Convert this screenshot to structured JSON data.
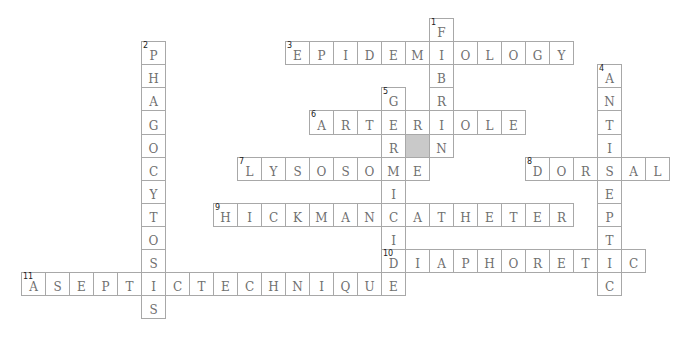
{
  "puzzle": {
    "origin_x": 21,
    "origin_y": 18,
    "cell_w": 24,
    "cell_h": 23.1,
    "colors": {
      "border": "#a8a8a8",
      "shaded": "#c9c9c9",
      "letter": "#6f6f6f"
    },
    "entries": [
      {
        "number": 1,
        "direction": "down",
        "answer": "FIBRIN",
        "row": 0,
        "col": 17
      },
      {
        "number": 2,
        "direction": "down",
        "answer": "PHAGOCYTOSIS",
        "row": 1,
        "col": 5
      },
      {
        "number": 3,
        "direction": "across",
        "answer": "EPIDEMIOLOGY",
        "row": 1,
        "col": 11
      },
      {
        "number": 4,
        "direction": "down",
        "answer": "ANTISEPTIC",
        "row": 2,
        "col": 24
      },
      {
        "number": 5,
        "direction": "down",
        "answer": "GERMICIDE",
        "row": 3,
        "col": 15
      },
      {
        "number": 6,
        "direction": "across",
        "answer": "ARTERIOLE",
        "row": 4,
        "col": 12
      },
      {
        "number": 7,
        "direction": "across",
        "answer": "LYSOSOME",
        "row": 6,
        "col": 9
      },
      {
        "number": 8,
        "direction": "across",
        "answer": "DORSAL",
        "row": 6,
        "col": 21
      },
      {
        "number": 9,
        "direction": "across",
        "answer": "HICKMANCATHETER",
        "row": 8,
        "col": 8
      },
      {
        "number": 10,
        "direction": "across",
        "answer": "DIAPHORETIC",
        "row": 10,
        "col": 15
      },
      {
        "number": 11,
        "direction": "across",
        "answer": "ASEPTICTECHNIQUE",
        "row": 11,
        "col": 0
      }
    ],
    "shaded_cells": [
      {
        "row": 5,
        "col": 16
      }
    ]
  }
}
